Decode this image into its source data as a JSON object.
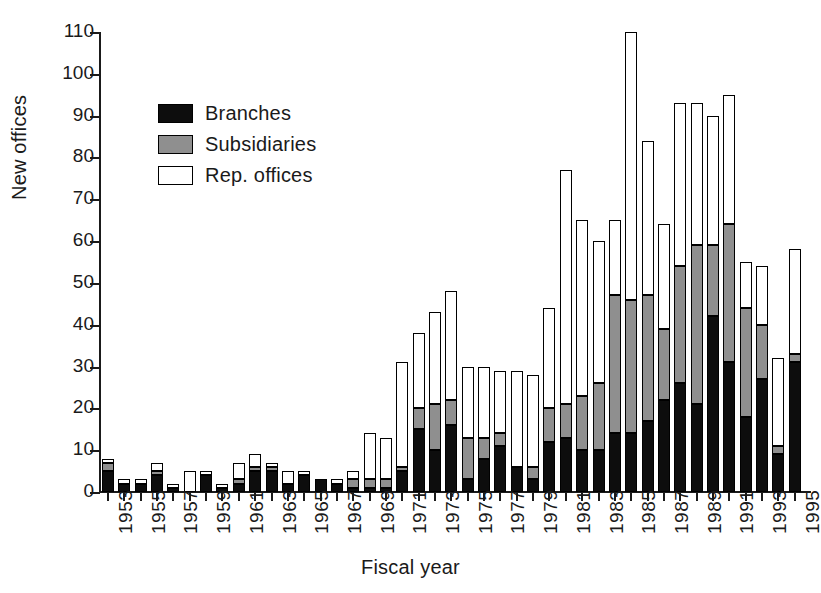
{
  "chart_data": {
    "type": "bar",
    "stacked": true,
    "title": "",
    "xlabel": "Fiscal year",
    "ylabel": "New offices",
    "ylim": [
      0,
      110
    ],
    "yticks": [
      0,
      10,
      20,
      30,
      40,
      50,
      60,
      70,
      80,
      90,
      100,
      110
    ],
    "grid": false,
    "legend_position": "upper-left inside",
    "colors": {
      "branches": "#0d0d0d",
      "subsidiaries": "#8f8f8f",
      "rep_offices": "#ffffff",
      "outline": "#000000"
    },
    "categories": [
      "1953",
      "1954",
      "1955",
      "1956",
      "1957",
      "1958",
      "1959",
      "1960",
      "1961",
      "1962",
      "1963",
      "1964",
      "1965",
      "1966",
      "1967",
      "1968",
      "1969",
      "1970",
      "1971",
      "1972",
      "1973",
      "1974",
      "1975",
      "1976",
      "1977",
      "1978",
      "1979",
      "1980",
      "1981",
      "1982",
      "1983",
      "1984",
      "1985",
      "1986",
      "1987",
      "1988",
      "1989",
      "1990",
      "1991",
      "1992",
      "1993",
      "1994",
      "1995"
    ],
    "xtick_labels": [
      "1953",
      "1955",
      "1957",
      "1959",
      "1961",
      "1963",
      "1965",
      "1967",
      "1969",
      "1971",
      "1973",
      "1975",
      "1977",
      "1979",
      "1981",
      "1983",
      "1985",
      "1987",
      "1989",
      "1991",
      "1993",
      "1995"
    ],
    "series": [
      {
        "name": "Branches",
        "values": [
          5,
          2,
          2,
          4,
          1,
          0,
          4,
          1,
          2,
          5,
          5,
          2,
          4,
          3,
          2,
          1,
          1,
          1,
          5,
          15,
          10,
          16,
          3,
          8,
          11,
          6,
          3,
          12,
          13,
          10,
          10,
          14,
          14,
          17,
          22,
          26,
          21,
          42,
          31,
          18,
          27,
          9,
          31
        ]
      },
      {
        "name": "Subsidiaries",
        "values": [
          2,
          0,
          0,
          1,
          0,
          0,
          0,
          0,
          1,
          1,
          1,
          0,
          0,
          0,
          0,
          2,
          2,
          2,
          1,
          5,
          11,
          6,
          10,
          5,
          3,
          0,
          3,
          8,
          8,
          13,
          16,
          33,
          32,
          30,
          17,
          28,
          38,
          17,
          33,
          26,
          13,
          2,
          2
        ]
      },
      {
        "name": "Rep. offices",
        "values": [
          1,
          1,
          1,
          2,
          1,
          5,
          1,
          1,
          4,
          3,
          1,
          3,
          1,
          0,
          1,
          2,
          11,
          10,
          25,
          18,
          22,
          26,
          17,
          17,
          15,
          23,
          22,
          24,
          56,
          42,
          34,
          18,
          64,
          37,
          25,
          39,
          34,
          31,
          31,
          11,
          14,
          21,
          25
        ]
      }
    ]
  },
  "legend": {
    "items": [
      {
        "label": "Branches",
        "swatch": "sw-branches"
      },
      {
        "label": "Subsidiaries",
        "swatch": "sw-subs"
      },
      {
        "label": "Rep. offices",
        "swatch": "sw-rep"
      }
    ]
  }
}
